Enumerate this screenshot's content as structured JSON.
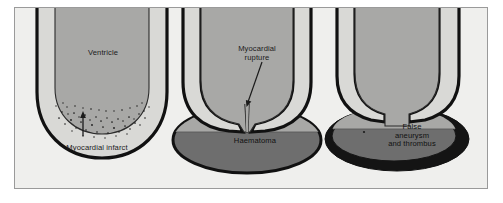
{
  "figure": {
    "background_color": "#efefed",
    "frame_border_color": "#9a9a9a",
    "page_background": "#ffffff"
  },
  "colors": {
    "outline": "#111111",
    "myocardium": "#d9d9d6",
    "ventricle_cavity": "#a8a8a6",
    "haematoma_fill": "#6e6e6e",
    "haematoma_top": "#a8a8a6",
    "thrombus_rim": "#141414",
    "stipple": "#1b1b1b",
    "label_text": "#1b1b1b"
  },
  "panels": [
    {
      "id": "panel-infarct",
      "name": "Myocardial infarct",
      "labels": [
        {
          "id": "ventricle",
          "text": "Ventricle"
        },
        {
          "id": "myocardial-infarct",
          "text": "Myocardial infarct"
        }
      ],
      "features": [
        "ventricle-cavity",
        "myocardial-wall",
        "stippled-infarct",
        "leader-arrow"
      ]
    },
    {
      "id": "panel-rupture",
      "name": "Myocardial rupture",
      "labels": [
        {
          "id": "myocardial-rupture",
          "text": "Myocardial\nrupture"
        },
        {
          "id": "haematoma",
          "text": "Haematoma"
        }
      ],
      "features": [
        "ventricle-cavity",
        "myocardial-wall",
        "rupture-tract",
        "haematoma-ellipse",
        "fluid-level",
        "leader-arrow"
      ]
    },
    {
      "id": "panel-false-aneurysm",
      "name": "False aneurysm and thrombus",
      "labels": [
        {
          "id": "false-aneurysm",
          "text": "False\naneurysm\nand thrombus"
        }
      ],
      "features": [
        "ventricle-cavity",
        "myocardial-wall",
        "wide-neck",
        "thrombus-ring",
        "aneurysm-cavity",
        "fluid-level"
      ]
    }
  ]
}
